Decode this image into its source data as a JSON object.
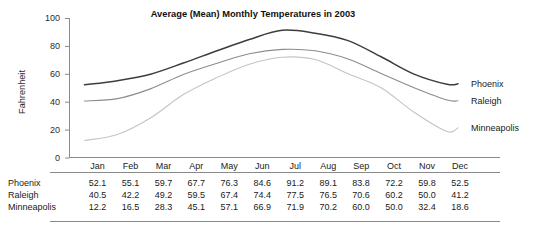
{
  "chart_data": {
    "type": "line",
    "title": "Average (Mean) Monthly Temperatures in 2003",
    "xlabel": "",
    "ylabel": "Fahrenheit",
    "ylim": [
      0,
      100
    ],
    "yticks": [
      "0",
      "20",
      "40",
      "60",
      "80",
      "100"
    ],
    "grid": false,
    "legend_position": "right-inline",
    "categories": [
      "Jan",
      "Feb",
      "Mar",
      "Apr",
      "May",
      "Jun",
      "Jul",
      "Aug",
      "Sep",
      "Oct",
      "Nov",
      "Dec"
    ],
    "series": [
      {
        "name": "Phoenix",
        "color": "#3d3d3d",
        "values": [
          52.1,
          55.1,
          59.7,
          67.7,
          76.3,
          84.6,
          91.2,
          89.1,
          83.8,
          72.2,
          59.8,
          52.5
        ]
      },
      {
        "name": "Raleigh",
        "color": "#8c8c8c",
        "values": [
          40.5,
          42.2,
          49.2,
          59.5,
          67.4,
          74.4,
          77.5,
          76.5,
          70.6,
          60.2,
          50.0,
          41.2
        ]
      },
      {
        "name": "Minneapolis",
        "color": "#c4c4c4",
        "values": [
          12.2,
          16.5,
          28.3,
          45.1,
          57.1,
          66.9,
          71.9,
          70.2,
          60.0,
          50.0,
          32.4,
          18.6
        ]
      }
    ]
  },
  "table": {
    "corner_label": "",
    "columns": [
      "Jan",
      "Feb",
      "Mar",
      "Apr",
      "May",
      "Jun",
      "Jul",
      "Aug",
      "Sep",
      "Oct",
      "Nov",
      "Dec"
    ],
    "rows": [
      {
        "label": "Phoenix",
        "values": [
          "52.1",
          "55.1",
          "59.7",
          "67.7",
          "76.3",
          "84.6",
          "91.2",
          "89.1",
          "83.8",
          "72.2",
          "59.8",
          "52.5"
        ]
      },
      {
        "label": "Raleigh",
        "values": [
          "40.5",
          "42.2",
          "49.2",
          "59.5",
          "67.4",
          "74.4",
          "77.5",
          "76.5",
          "70.6",
          "60.2",
          "50.0",
          "41.2"
        ]
      },
      {
        "label": "Minneapolis",
        "values": [
          "12.2",
          "16.5",
          "28.3",
          "45.1",
          "57.1",
          "66.9",
          "71.9",
          "70.2",
          "60.0",
          "50.0",
          "32.4",
          "18.6"
        ]
      }
    ]
  }
}
